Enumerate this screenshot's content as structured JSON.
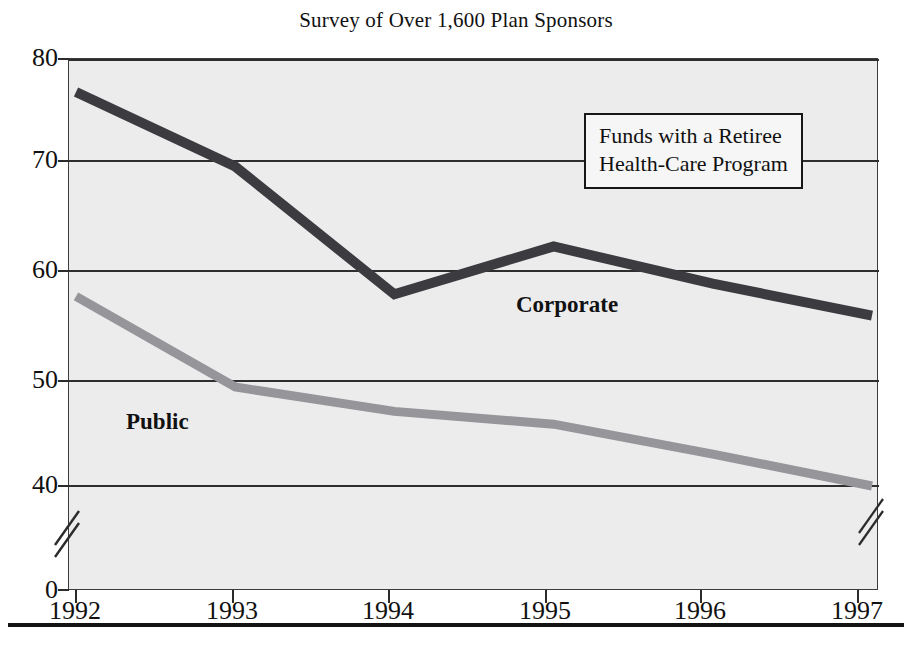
{
  "chart_data": {
    "type": "line",
    "title": "Survey of Over 1,600 Plan Sponsors",
    "xlabel": "",
    "ylabel": "",
    "categories": [
      "1992",
      "1993",
      "1994",
      "1995",
      "1996",
      "1997"
    ],
    "x": [
      1992,
      1993,
      1994,
      1995,
      1996,
      1997
    ],
    "series": [
      {
        "name": "Corporate",
        "color": "#3b3b40",
        "values": [
          77,
          70,
          58,
          62.5,
          59,
          56
        ]
      },
      {
        "name": "Public",
        "color": "#95959a",
        "values": [
          57.8,
          49.3,
          47,
          45.8,
          43,
          40
        ]
      }
    ],
    "ylim": [
      0,
      80
    ],
    "ytick_labels": [
      "80",
      "70",
      "60",
      "50",
      "40",
      "0"
    ],
    "ytick_values": [
      80,
      70,
      60,
      50,
      40,
      0
    ],
    "axis_break": true,
    "axis_break_note": "y-axis broken between 40 and 0",
    "grid": true,
    "grid_axis": "y",
    "legend_position": "inside-upper-right",
    "annotation": "Funds with a Retiree Health-Care Program",
    "plot_background": "#ececed"
  },
  "title": "Survey of Over 1,600 Plan Sponsors",
  "legend": {
    "line1": "Funds with a Retiree",
    "line2": "Health-Care Program"
  },
  "series_labels": {
    "corporate": "Corporate",
    "public": "Public"
  },
  "axes": {
    "y_ticks": [
      {
        "label": "80"
      },
      {
        "label": "70"
      },
      {
        "label": "60"
      },
      {
        "label": "50"
      },
      {
        "label": "40"
      },
      {
        "label": "0"
      }
    ],
    "x_ticks": [
      {
        "label": "1992"
      },
      {
        "label": "1993"
      },
      {
        "label": "1994"
      },
      {
        "label": "1995"
      },
      {
        "label": "1996"
      },
      {
        "label": "1997"
      }
    ]
  }
}
